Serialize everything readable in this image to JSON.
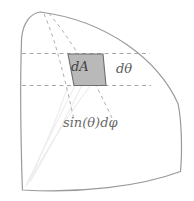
{
  "figure": {
    "name": "spherical-surface-element-diagram",
    "background_color": "#ffffff",
    "outline_color": "#9a9a9a",
    "dashed_color": "#a8a8a8",
    "faint_line_color": "#ececec",
    "patch_fill_color": "#b9b9b9",
    "patch_stroke_color": "#6e6e6e",
    "labels": {
      "area_element": "dA",
      "polar_increment": "dθ",
      "azimuthal_arc": "sin(θ)dφ"
    }
  },
  "geometry": {
    "outline_path": "M 40.5 12 C 30 13.5 22.5 24 21.2 40 C 20.2 70 21.0 140 22.5 190 C 80 193 140 186 180 172 C 182 150 181.5 120 178 104 C 160 62 110 22 40.5 12 Z",
    "latitude_upper": {
      "x1": 22,
      "y1": 53.5,
      "x2": 150,
      "y2": 53.5
    },
    "latitude_lower": {
      "x1": 22,
      "y1": 85.5,
      "x2": 150,
      "y2": 85.5
    },
    "meridian_left": "M 44 14 C 52 32 62 62 74 120",
    "meridian_right": "M 48.5 13.5 C 62 30 84 60 112 118",
    "patch_polygon": "68,54 103,54 106,85 74,85",
    "faint_wedge": [
      "M 26 186 C 48 140 62 110 76 84",
      "M 26 186 C 52 142 70 112 88 86",
      "M 26 186 C 44 150 56 122 68 86"
    ]
  }
}
